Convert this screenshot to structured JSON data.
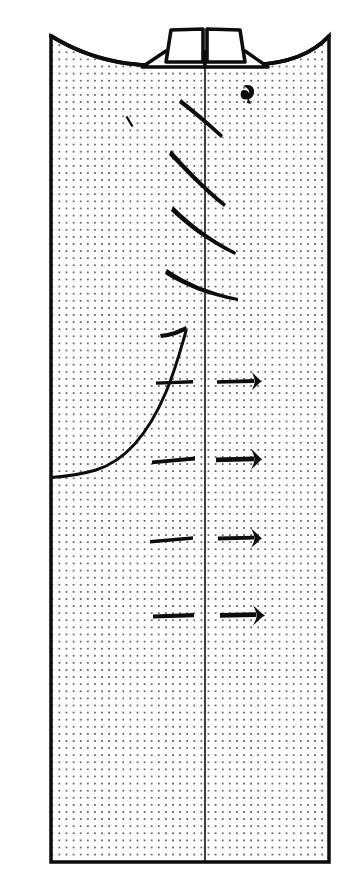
{
  "figure": {
    "canvas": {
      "width": 363,
      "height": 893,
      "background": "#ffffff"
    },
    "ink_color": "#0d0d0d",
    "stipple": {
      "name": "dot-stipple-fill",
      "dot_color": "#2b2b2b",
      "dot_radius": 0.85,
      "spacing_x": 7.1,
      "spacing_y": 7.1,
      "description": "regular square grid of small dots filling the whole panel interior"
    },
    "panel": {
      "name": "main-panel",
      "left": 51,
      "right": 329,
      "bottom": 862,
      "top_left_y": 36,
      "top_right_y": 36,
      "top_dip_y": 62,
      "border_width": 3.5,
      "description": "tall rectangular panel with a downward-sagging curved top edge"
    },
    "center_line": {
      "name": "center-vertical-axis",
      "x": 205,
      "y_top": 58,
      "y_bottom": 862,
      "width": 1.6
    },
    "top_fixtures": {
      "name": "top-fixtures-group",
      "description": "two trapezoidal box shapes sitting on flanged bases astride the centre axis",
      "items": [
        {
          "label": "left-fixture",
          "box": "M165,63 L160,30 L203,29 L203,62 Z",
          "flange": "M143,66 L165,52 L205,52 L205,66 Z"
        },
        {
          "label": "right-fixture",
          "box": "M207,62 L207,29 L250,30 L245,63 Z",
          "flange": "M205,66 L205,52 L245,52 L267,66 Z"
        }
      ]
    },
    "curve_marks": {
      "name": "diagonal-stroke-group",
      "description": "five tapered diagonal strokes crossing the centre axis, progressively flatter toward the bottom",
      "strokes": [
        {
          "label": "stroke-1",
          "path": "M182,101 C191,108 205,120 221,136",
          "width_start": 3.6,
          "width_end": 1.4
        },
        {
          "label": "stroke-2",
          "path": "M172,152 C184,165 203,186 225,205",
          "width_start": 3.8,
          "width_end": 1.4
        },
        {
          "label": "stroke-3",
          "path": "M174,208 C188,222 208,239 235,253",
          "width_start": 4.0,
          "width_end": 1.4
        },
        {
          "label": "stroke-4",
          "path": "M168,271 C186,283 208,293 237,299",
          "width_start": 4.0,
          "width_end": 1.4
        },
        {
          "label": "stroke-5",
          "path": "M162,337 C176,336 183,334 186,331",
          "width_start": 3.4,
          "width_end": 1.6
        }
      ]
    },
    "s_curve": {
      "name": "sigmoid-profile-curve",
      "description": "a large S-shaped profile curve rising from outside the left border to a plateau at upper middle",
      "path": "M16,478 C46,479 72,477 96,470 C128,460 150,430 166,392 C176,368 181,348 186,331",
      "width": 3.0
    },
    "left_dashes": {
      "name": "left-dash-group",
      "description": "four short horizontal dash marks on the left half",
      "items": [
        {
          "label": "dash-1",
          "x1": 156,
          "x2": 193,
          "y": 383,
          "width": 3.0
        },
        {
          "label": "dash-2",
          "x1": 152,
          "x2": 195,
          "y": 460,
          "width": 3.4
        },
        {
          "label": "dash-3",
          "x1": 150,
          "x2": 193,
          "y": 539,
          "width": 3.2
        },
        {
          "label": "dash-4",
          "x1": 153,
          "x2": 194,
          "y": 616,
          "width": 3.6
        }
      ]
    },
    "right_arrows": {
      "name": "right-arrow-group",
      "description": "four nail- or T-shaped marks on the right half, shaft to the left and flared head to the right",
      "items": [
        {
          "label": "arrow-1",
          "x1": 217,
          "x2": 261,
          "y": 381,
          "shaft_width": 3.0,
          "head_height": 17
        },
        {
          "label": "arrow-2",
          "x1": 216,
          "x2": 262,
          "y": 459,
          "shaft_width": 4.0,
          "head_height": 19
        },
        {
          "label": "arrow-3",
          "x1": 218,
          "x2": 262,
          "y": 538,
          "shaft_width": 3.2,
          "head_height": 18
        },
        {
          "label": "arrow-4",
          "x1": 220,
          "x2": 265,
          "y": 615,
          "shaft_width": 4.0,
          "head_height": 18
        }
      ]
    },
    "small_marks": {
      "name": "small-mark-group",
      "items": [
        {
          "label": "tick-mark-left",
          "path": "M128,117 L133,126",
          "width": 2.4
        },
        {
          "label": "blob-mark-right",
          "cx": 247,
          "cy": 92,
          "description": "small dark tadpole / comma blob"
        }
      ]
    }
  }
}
